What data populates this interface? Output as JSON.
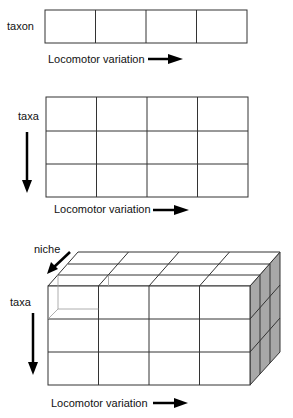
{
  "panels": [
    {
      "row_label": "taxon",
      "x_label": "Locomotor variation",
      "columns": 4,
      "rows": 1
    },
    {
      "row_label": "taxa",
      "x_label": "Locomotor variation",
      "columns": 4,
      "rows": 3
    },
    {
      "row_label": "taxa",
      "depth_label": "niche",
      "x_label": "Locomotor variation",
      "columns": 4,
      "rows": 3,
      "depth": 3
    }
  ],
  "colors": {
    "line": "#333333",
    "side_shade": "#a8a8a8",
    "arrow": "#000000"
  }
}
